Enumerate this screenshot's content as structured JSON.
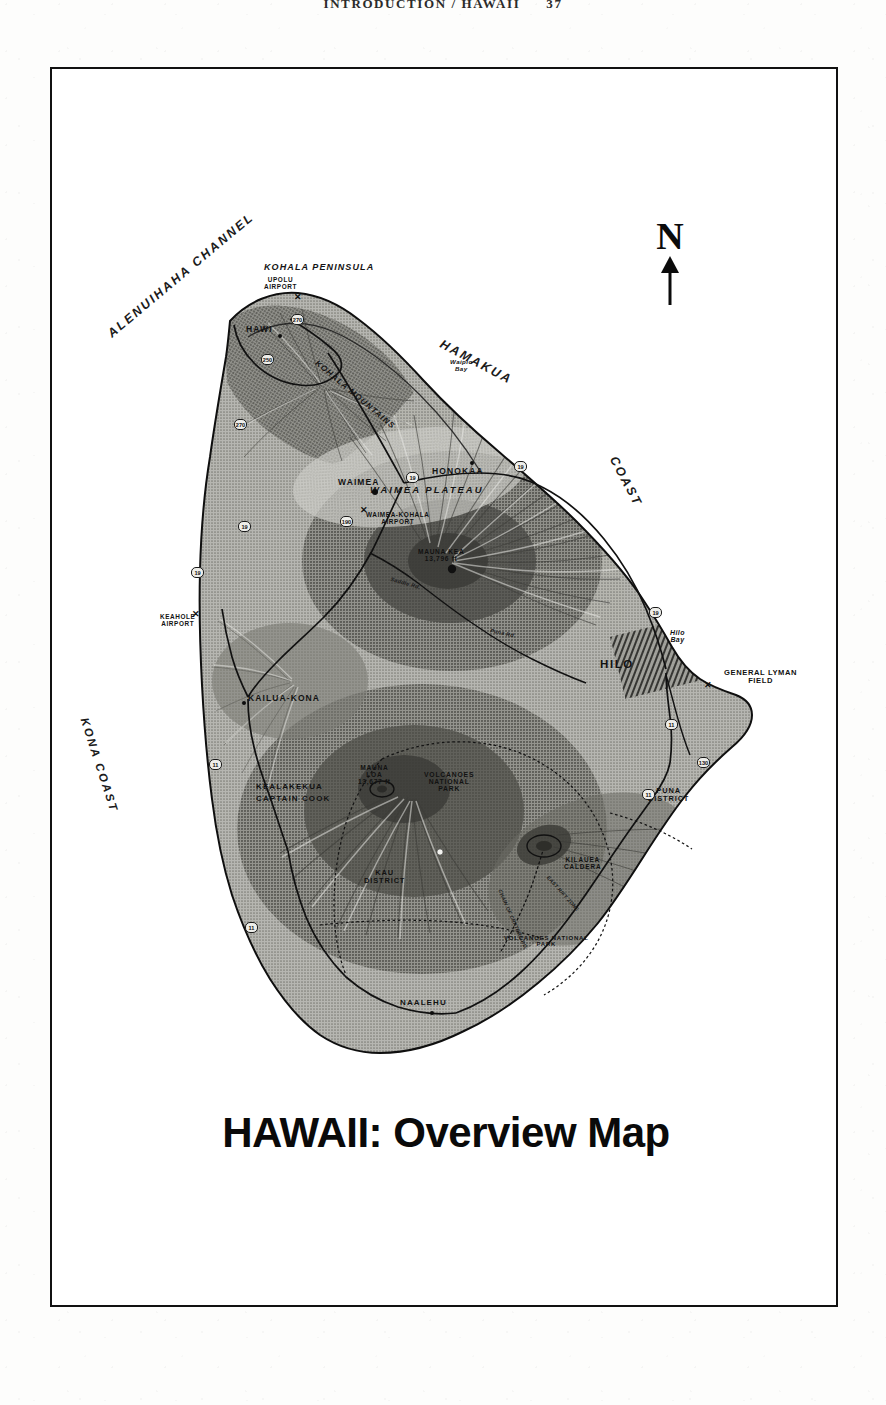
{
  "running_head": {
    "text": "INTRODUCTION / HAWAII",
    "page_number": "37"
  },
  "map": {
    "title": "HAWAII:  Overview Map",
    "north_arrow_label": "N",
    "ocean_labels": [
      {
        "name": "alenuihaha-channel",
        "text": "ALENUIHAHA CHANNEL"
      },
      {
        "name": "kona-coast",
        "text": "KONA COAST"
      },
      {
        "name": "hamakua",
        "text": "HAMAKUA"
      },
      {
        "name": "hamakua-coast",
        "text": "COAST"
      }
    ],
    "regions": [
      {
        "name": "kohala-peninsula",
        "text": "KOHALA PENINSULA"
      },
      {
        "name": "kohala-mountains",
        "text": "KOHALA MOUNTAINS"
      },
      {
        "name": "waimea-plateau",
        "text": "WAIMEA PLATEAU"
      }
    ],
    "districts": [
      {
        "name": "kau-district",
        "line1": "KAU",
        "line2": "DISTRICT"
      },
      {
        "name": "puna-district",
        "line1": "PUNA",
        "line2": "DISTRICT"
      }
    ],
    "parks": [
      {
        "name": "volcanoes-national-park-upper",
        "line1": "VOLCANOES",
        "line2": "NATIONAL",
        "line3": "PARK"
      },
      {
        "name": "volcanoes-national-park-lower",
        "line1": "VOLCANOES NATIONAL",
        "line2": "PARK"
      }
    ],
    "cities": [
      {
        "name": "hawi",
        "text": "HAWI"
      },
      {
        "name": "waimea",
        "text": "WAIMEA"
      },
      {
        "name": "honokaa",
        "text": "HONOKAA"
      },
      {
        "name": "hilo",
        "text": "HILO",
        "size": "big"
      },
      {
        "name": "kailua-kona",
        "text": "KAILUA-KONA"
      },
      {
        "name": "kealakekua",
        "text": "KEALAKEKUA"
      },
      {
        "name": "captain-cook",
        "text": "CAPTAIN COOK"
      },
      {
        "name": "naalehu",
        "text": "NAALEHU"
      }
    ],
    "airports": [
      {
        "name": "upolu-airport",
        "line1": "UPOLU",
        "line2": "AIRPORT"
      },
      {
        "name": "waimea-kohala-airport",
        "line1": "WAIMEA-KOHALA",
        "line2": "AIRPORT"
      },
      {
        "name": "keahole-airport",
        "line1": "KEAHOLE",
        "line2": "AIRPORT"
      },
      {
        "name": "general-lyman-field",
        "line1": "GENERAL LYMAN",
        "line2": "FIELD"
      }
    ],
    "peaks": [
      {
        "name": "mauna-kea",
        "line1": "MAUNA KEA",
        "line2": "13,796 ft"
      },
      {
        "name": "mauna-loa",
        "line1": "MAUNA",
        "line2": "LOA",
        "line3": "13,677 ft"
      }
    ],
    "features": [
      {
        "name": "waipio-bay",
        "line1": "Waipio",
        "line2": "Bay"
      },
      {
        "name": "hilo-bay",
        "line1": "Hilo",
        "line2": "Bay"
      },
      {
        "name": "kilauea-caldera",
        "line1": "KILAUEA",
        "line2": "CALDERA"
      }
    ],
    "roads": [
      {
        "name": "saddle-road",
        "text": "Saddle Rd."
      },
      {
        "name": "puna-road",
        "text": "Puna Rd."
      },
      {
        "name": "chain-of-craters-road",
        "text": "CHAIN OF CRATERS RD."
      },
      {
        "name": "kilauea-rift-zone",
        "text": "EAST RIFT ZONE"
      }
    ],
    "route_shields": [
      {
        "name": "route-shield-270-north",
        "text": "270"
      },
      {
        "name": "route-shield-250",
        "text": "250"
      },
      {
        "name": "route-shield-270-west",
        "text": "270"
      },
      {
        "name": "route-shield-19-waimea",
        "text": "19"
      },
      {
        "name": "route-shield-19-honokaa",
        "text": "19"
      },
      {
        "name": "route-shield-190",
        "text": "190"
      },
      {
        "name": "route-shield-19-north",
        "text": "19"
      },
      {
        "name": "route-shield-19-hilo",
        "text": "19"
      },
      {
        "name": "route-shield-11-hilo",
        "text": "11"
      },
      {
        "name": "route-shield-130",
        "text": "130"
      },
      {
        "name": "route-shield-11-puna",
        "text": "11"
      },
      {
        "name": "route-shield-19-keahole",
        "text": "19"
      },
      {
        "name": "route-shield-11-kona",
        "text": "11"
      },
      {
        "name": "route-shield-11-south",
        "text": "11"
      }
    ],
    "colors": {
      "ink": "#111111",
      "paper": "#ffffff",
      "land_light": "#b9b9b4",
      "land_mid": "#8e8e88",
      "land_dark": "#5c5c57",
      "frame": "#111111"
    }
  }
}
